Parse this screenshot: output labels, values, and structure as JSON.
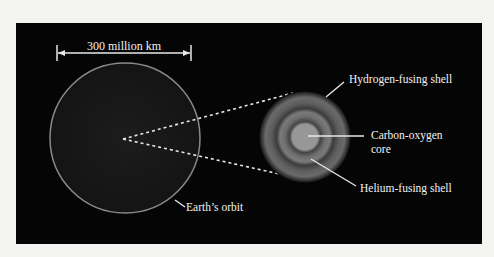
{
  "diagram": {
    "scale_label": "300 million km",
    "earth_orbit_label": "Earth’s orbit",
    "labels": {
      "hydrogen_shell": "Hydrogen-fusing shell",
      "core_line1": "Carbon-oxygen",
      "core_line2": "core",
      "helium_shell": "Helium-fusing shell"
    },
    "colors": {
      "background": "#050505",
      "page": "#f4f4f2",
      "orbit": "#8a8a8a",
      "label": "#f2f2f2"
    }
  }
}
